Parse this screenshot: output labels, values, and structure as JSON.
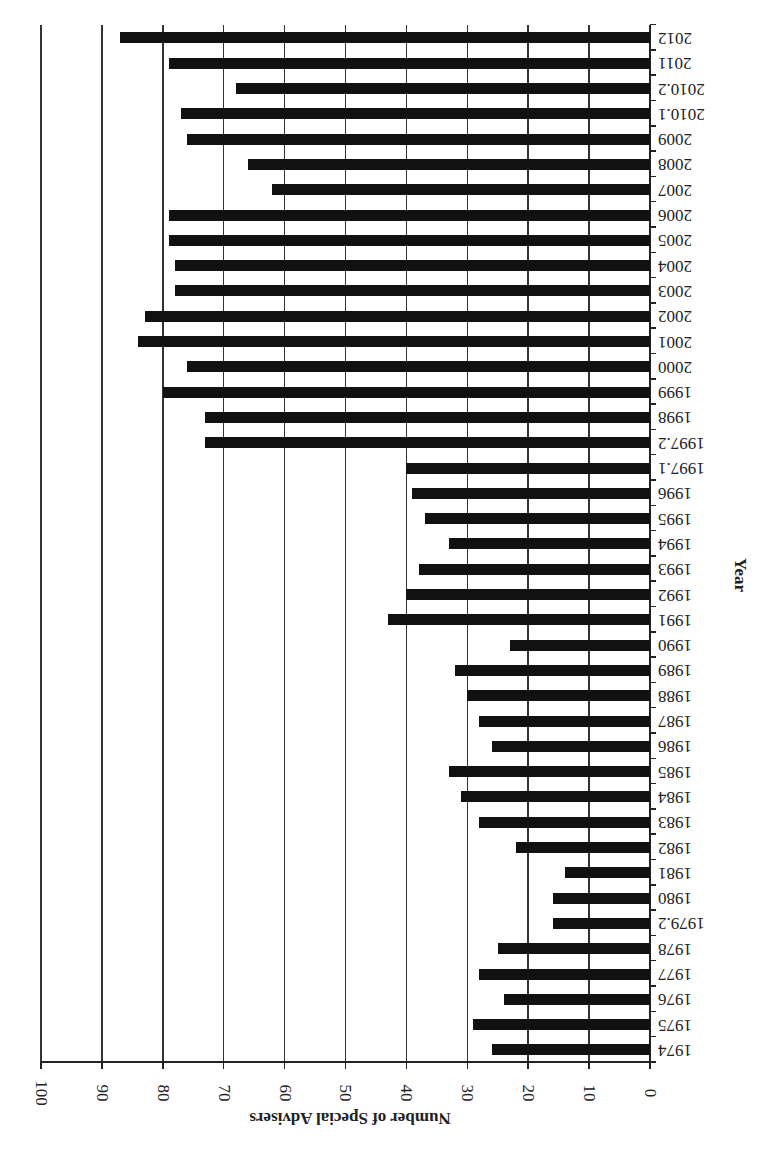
{
  "chart_data": {
    "type": "bar",
    "orientation": "horizontal",
    "rendered_rotation_deg": 180,
    "title": "",
    "xlabel": "Number of Special Advisers",
    "ylabel": "Year",
    "xlim": [
      0,
      100
    ],
    "x_ticks": [
      "0",
      "10",
      "20",
      "30",
      "40",
      "50",
      "60",
      "70",
      "80",
      "90",
      "100"
    ],
    "grid": "vertical lines at each 10",
    "legend": "none",
    "bar_color": "#111111",
    "categories": [
      "1974",
      "1975",
      "1976",
      "1977",
      "1978",
      "1979.2",
      "1980",
      "1981",
      "1982",
      "1983",
      "1984",
      "1985",
      "1986",
      "1987",
      "1988",
      "1989",
      "1990",
      "1991",
      "1992",
      "1993",
      "1994",
      "1995",
      "1996",
      "1997.1",
      "1997.2",
      "1998",
      "1999",
      "2000",
      "2001",
      "2002",
      "2003",
      "2004",
      "2005",
      "2006",
      "2007",
      "2008",
      "2009",
      "2010.1",
      "2010.2",
      "2011",
      "2012"
    ],
    "values": [
      26,
      29,
      24,
      28,
      25,
      16,
      16,
      14,
      22,
      28,
      31,
      33,
      26,
      28,
      30,
      32,
      23,
      43,
      40,
      38,
      33,
      37,
      39,
      40,
      73,
      73,
      80,
      76,
      84,
      83,
      78,
      78,
      79,
      79,
      62,
      66,
      76,
      77,
      68,
      79,
      87
    ]
  }
}
